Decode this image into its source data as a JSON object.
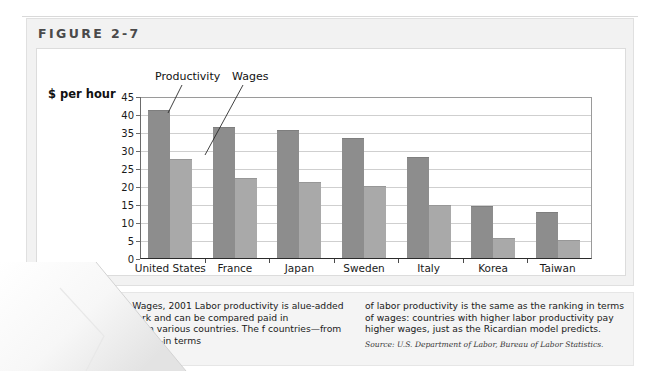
{
  "figure": {
    "label": "FIGURE 2-7",
    "axis_title": "$ per hour"
  },
  "annotations": {
    "productivity": "Productivity",
    "wages": "Wages"
  },
  "caption": {
    "left_text": "uctivity and Wages, 2001 Labor productivity is alue-added per hour of work and can be compared paid in manufacturing in various countries. The f countries—from highest to lowest—in terms",
    "right_text": "of labor productivity is the same as the ranking in terms of wages: countries with higher labor productivity pay higher wages, just as the Ricardian model predicts.",
    "source": "Source: U.S. Department of Labor, Bureau of Labor Statistics."
  },
  "chart_data": {
    "type": "bar",
    "title": "FIGURE 2-7",
    "xlabel": "",
    "ylabel": "$ per hour",
    "ylim": [
      0,
      45
    ],
    "ytick_labels": [
      "0",
      "5",
      "10",
      "15",
      "20",
      "25",
      "30",
      "35",
      "40",
      "45"
    ],
    "ytick_values": [
      0,
      5,
      10,
      15,
      20,
      25,
      30,
      35,
      40,
      45
    ],
    "grid": true,
    "legend_position": "annotated-leader-lines",
    "categories": [
      "United States",
      "France",
      "Japan",
      "Sweden",
      "Italy",
      "Korea",
      "Taiwan"
    ],
    "series": [
      {
        "name": "Productivity",
        "color": "#8d8d8d",
        "values": [
          41.3,
          36.8,
          35.9,
          33.5,
          28.2,
          14.8,
          13.0
        ]
      },
      {
        "name": "Wages",
        "color": "#a9a9a9",
        "values": [
          27.7,
          22.6,
          21.4,
          20.3,
          15.0,
          5.9,
          5.4
        ]
      }
    ]
  }
}
